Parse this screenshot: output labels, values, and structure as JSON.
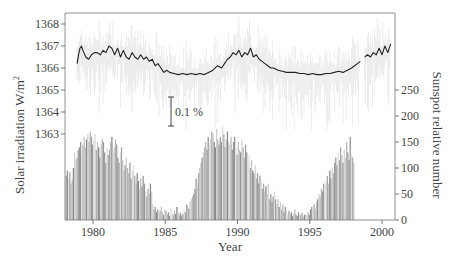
{
  "chart_data": {
    "type": "line+bar",
    "title": "",
    "xlabel": "Year",
    "ylabel_left": "Solar irradiation W/m²",
    "ylabel_right": "Sunspot relative number",
    "annotation": "0.1 %",
    "x_ticks": [
      1980,
      1985,
      1990,
      1995,
      2000
    ],
    "y_left_ticks": [
      1363,
      1364,
      1365,
      1366,
      1367,
      1368
    ],
    "y_right_ticks": [
      0,
      50,
      100,
      150,
      200,
      250
    ],
    "xlim": [
      1978.1,
      2000.9
    ],
    "ylim_left": [
      1363,
      1368.5
    ],
    "ylim_right": [
      0,
      250
    ],
    "series": [
      {
        "name": "Solar irradiance (smoothed)",
        "type": "line",
        "axis": "left",
        "x": [
          1978.9,
          1979.0,
          1979.1,
          1979.2,
          1979.3,
          1979.5,
          1979.7,
          1979.9,
          1980.1,
          1980.3,
          1980.5,
          1980.7,
          1980.9,
          1981.1,
          1981.3,
          1981.5,
          1981.7,
          1981.9,
          1982.1,
          1982.3,
          1982.5,
          1982.7,
          1982.9,
          1983.1,
          1983.3,
          1983.5,
          1983.7,
          1983.9,
          1984.1,
          1984.3,
          1984.5,
          1984.7,
          1984.9,
          1985.1,
          1985.3,
          1985.6,
          1985.9,
          1986.2,
          1986.5,
          1986.8,
          1987.1,
          1987.4,
          1987.7,
          1988.0,
          1988.3,
          1988.6,
          1988.9,
          1989.1,
          1989.3,
          1989.5,
          1989.7,
          1989.9,
          1990.1,
          1990.3,
          1990.5,
          1990.7,
          1990.9,
          1991.1,
          1991.3,
          1991.5,
          1991.7,
          1991.9,
          1992.1,
          1992.3,
          1992.5,
          1992.8,
          1993.1,
          1993.4,
          1993.7,
          1994.0,
          1994.3,
          1994.6,
          1994.9,
          1995.2,
          1995.5,
          1995.8,
          1996.1,
          1996.4,
          1996.7,
          1997.0,
          1997.3,
          1997.6,
          1997.9,
          1998.1,
          1998.3,
          1998.5
        ],
        "values": [
          1366.2,
          1366.6,
          1366.9,
          1367.0,
          1366.8,
          1366.5,
          1366.4,
          1366.6,
          1366.7,
          1366.7,
          1366.6,
          1366.8,
          1366.7,
          1367.0,
          1366.9,
          1366.6,
          1366.9,
          1366.5,
          1366.8,
          1366.5,
          1366.4,
          1366.7,
          1366.5,
          1366.4,
          1366.6,
          1366.4,
          1366.5,
          1366.3,
          1366.4,
          1366.1,
          1366.2,
          1366.0,
          1365.8,
          1365.9,
          1365.8,
          1365.75,
          1365.7,
          1365.75,
          1365.7,
          1365.75,
          1365.7,
          1365.75,
          1365.7,
          1365.8,
          1365.9,
          1366.1,
          1366.0,
          1366.2,
          1366.4,
          1366.5,
          1366.7,
          1366.6,
          1366.8,
          1366.5,
          1366.7,
          1366.6,
          1366.9,
          1366.5,
          1366.6,
          1366.4,
          1366.3,
          1366.2,
          1366.1,
          1366.0,
          1366.0,
          1365.9,
          1365.85,
          1365.8,
          1365.8,
          1365.8,
          1365.75,
          1365.75,
          1365.7,
          1365.75,
          1365.7,
          1365.7,
          1365.75,
          1365.75,
          1365.8,
          1365.85,
          1365.8,
          1365.9,
          1366.0,
          1366.1,
          1366.2,
          1366.3
        ]
      },
      {
        "name": "Solar irradiance (late segment)",
        "type": "line",
        "axis": "left",
        "x": [
          1998.8,
          1999.0,
          1999.2,
          1999.4,
          1999.6,
          1999.8,
          2000.0,
          2000.2,
          2000.4,
          2000.6
        ],
        "values": [
          1366.5,
          1366.6,
          1366.5,
          1366.7,
          1366.6,
          1366.9,
          1366.6,
          1367.0,
          1366.7,
          1367.1
        ]
      },
      {
        "name": "Sunspot relative number (monthly)",
        "type": "bar",
        "axis": "right",
        "x_start": 1978.1,
        "step": 0.0833,
        "values": [
          85,
          95,
          80,
          92,
          70,
          78,
          100,
          130,
          115,
          120,
          135,
          140,
          150,
          125,
          145,
          160,
          140,
          155,
          165,
          150,
          170,
          160,
          145,
          155,
          165,
          135,
          150,
          140,
          120,
          145,
          155,
          150,
          130,
          110,
          140,
          125,
          135,
          150,
          160,
          130,
          140,
          155,
          145,
          120,
          110,
          130,
          140,
          115,
          95,
          105,
          120,
          100,
          90,
          110,
          80,
          95,
          105,
          85,
          70,
          90,
          75,
          60,
          80,
          65,
          85,
          70,
          55,
          45,
          60,
          50,
          70,
          55,
          30,
          20,
          25,
          15,
          20,
          12,
          18,
          25,
          15,
          10,
          20,
          18,
          12,
          15,
          8,
          22,
          14,
          10,
          18,
          12,
          25,
          16,
          10,
          14,
          8,
          12,
          20,
          15,
          30,
          28,
          22,
          35,
          40,
          45,
          50,
          60,
          80,
          70,
          90,
          100,
          110,
          120,
          130,
          140,
          150,
          135,
          160,
          145,
          155,
          170,
          165,
          150,
          140,
          175,
          155,
          145,
          160,
          150,
          180,
          165,
          140,
          155,
          170,
          150,
          145,
          160,
          135,
          150,
          160,
          140,
          125,
          150,
          135,
          130,
          155,
          140,
          120,
          145,
          130,
          110,
          125,
          100,
          115,
          95,
          90,
          105,
          80,
          90,
          70,
          85,
          75,
          60,
          70,
          55,
          65,
          50,
          70,
          40,
          50,
          35,
          45,
          55,
          40,
          30,
          40,
          25,
          35,
          20,
          30,
          15,
          25,
          20,
          10,
          18,
          12,
          15,
          8,
          12,
          20,
          10,
          8,
          15,
          12,
          10,
          14,
          6,
          10,
          12,
          8,
          15,
          10,
          20,
          25,
          18,
          30,
          22,
          35,
          40,
          50,
          45,
          60,
          55,
          70,
          65,
          75,
          85,
          70,
          95,
          80,
          100,
          90,
          110,
          120,
          105,
          130,
          115,
          140,
          125,
          110,
          135,
          120,
          150,
          130,
          115,
          160,
          125,
          120,
          110
        ]
      }
    ],
    "grid": false,
    "legend": null
  },
  "page": {
    "x_axis_label": "Year",
    "y_left_label": "Solar irradiation W/m",
    "y_left_label_sup": "2",
    "y_right_label": "Sunspot relative number",
    "annotation_text": "0.1 %"
  }
}
